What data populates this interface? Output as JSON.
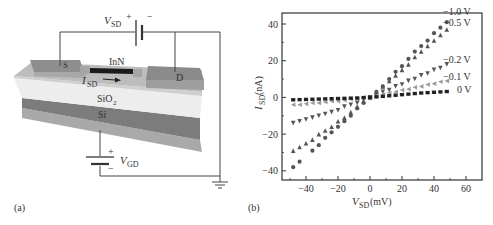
{
  "panel_a": {
    "label": "(a)",
    "layers": {
      "top_material": "InN",
      "oxide": "SiO",
      "oxide_sub": "2",
      "substrate": "Si"
    },
    "contacts": {
      "source": "S",
      "drain": "D"
    },
    "current": {
      "symbol": "I",
      "sub": "SD"
    },
    "source_drain_battery": {
      "symbol": "V",
      "sub": "SD",
      "plus": "+",
      "minus": "−"
    },
    "gate_battery": {
      "symbol": "V",
      "sub": "GD",
      "plus": "+",
      "minus": "−"
    },
    "colors": {
      "contact": "#8a8a8a",
      "channel_layer": "#b8b8b8",
      "nanowire": "#1a1a1a",
      "oxide": "#ececec",
      "silicon": "#7a7a7a",
      "bottom": "#a0a0a0",
      "wire": "#444444"
    }
  },
  "panel_b": {
    "label": "(b)",
    "xlabel_symbol": "V",
    "xlabel_sub": "SD",
    "xlabel_unit": " (mV)",
    "ylabel_symbol": "I",
    "ylabel_sub": "SD",
    "ylabel_unit": " (nA)"
  },
  "chart_data": {
    "type": "scatter",
    "title": "",
    "xlabel": "V_SD (mV)",
    "ylabel": "I_SD (nA)",
    "xlim": [
      -55,
      70
    ],
    "ylim": [
      -45,
      46
    ],
    "xticks": [
      -40,
      -20,
      0,
      20,
      40,
      60
    ],
    "yticks": [
      -40,
      -20,
      0,
      20,
      40
    ],
    "grid": false,
    "legend_position": "inline-right",
    "series": [
      {
        "name": "-1.0 V",
        "marker": "circle",
        "color": "#555555",
        "x": [
          -48,
          -44,
          -36,
          -32,
          -28,
          -24,
          -20,
          -16,
          -12,
          -8,
          -4,
          0,
          4,
          8,
          12,
          16,
          20,
          24,
          28,
          32,
          36,
          40,
          44,
          48
        ],
        "y": [
          -38,
          -35,
          -29,
          -26,
          -22,
          -19,
          -16,
          -13,
          -10,
          -6,
          -3,
          0,
          3,
          6,
          10,
          14,
          17,
          21,
          25,
          28,
          31,
          35,
          38,
          41
        ]
      },
      {
        "name": "-0.5 V",
        "marker": "triangle-up",
        "color": "#555555",
        "x": [
          -48,
          -44,
          -40,
          -36,
          -32,
          -28,
          -24,
          -20,
          -16,
          -12,
          -8,
          -4,
          0,
          4,
          8,
          12,
          16,
          20,
          24,
          28,
          32,
          36,
          40,
          44,
          48
        ],
        "y": [
          -29,
          -27,
          -25,
          -23,
          -20,
          -18,
          -16,
          -13,
          -11,
          -8,
          -5,
          -2,
          0,
          3,
          6,
          9,
          12,
          15,
          18,
          22,
          25,
          28,
          31,
          34,
          37
        ]
      },
      {
        "name": "-0.2 V",
        "marker": "triangle-down",
        "color": "#555555",
        "x": [
          -48,
          -44,
          -40,
          -36,
          -32,
          -28,
          -24,
          -20,
          -16,
          -12,
          -8,
          -4,
          0,
          4,
          8,
          12,
          16,
          20,
          24,
          28,
          32,
          36,
          40,
          44,
          48
        ],
        "y": [
          -14,
          -13,
          -12,
          -11,
          -10,
          -9,
          -8,
          -7,
          -5,
          -4,
          -3,
          -1,
          0,
          1,
          3,
          4,
          6,
          7,
          9,
          10,
          12,
          13,
          15,
          16,
          18
        ]
      },
      {
        "name": "-0.1 V",
        "marker": "triangle-left",
        "color": "#9a9a9a",
        "x": [
          -48,
          -44,
          -40,
          -36,
          -32,
          -28,
          -24,
          -20,
          -16,
          -12,
          -8,
          -4,
          0,
          4,
          8,
          12,
          16,
          20,
          24,
          28,
          32,
          36,
          40,
          44,
          48
        ],
        "y": [
          -4,
          -4,
          -3.5,
          -3,
          -3,
          -2.5,
          -2,
          -2,
          -1.5,
          -1,
          -1,
          0,
          0,
          1,
          1.5,
          2.5,
          3,
          4,
          4.5,
          5.5,
          6,
          7,
          7.5,
          8.5,
          9
        ]
      },
      {
        "name": "0 V",
        "marker": "square",
        "color": "#222222",
        "x": [
          -48,
          -44,
          -40,
          -36,
          -32,
          -28,
          -24,
          -20,
          -16,
          -12,
          -8,
          -4,
          0,
          4,
          8,
          12,
          16,
          20,
          24,
          28,
          32,
          36,
          40,
          44,
          48
        ],
        "y": [
          -1.3,
          -1.2,
          -1.1,
          -1,
          -0.9,
          -0.8,
          -0.7,
          -0.6,
          -0.5,
          -0.4,
          -0.3,
          -0.1,
          0,
          0.3,
          0.6,
          0.9,
          1.2,
          1.5,
          1.8,
          2.1,
          2.4,
          2.6,
          2.8,
          3,
          3.2
        ]
      }
    ]
  }
}
